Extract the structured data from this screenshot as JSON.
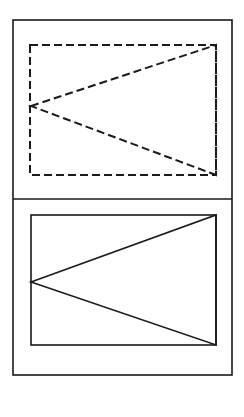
{
  "figure": {
    "title": "Two-panel line drawing: dashed rectangle with inscribed triangle above, solid rectangle with inscribed triangle below",
    "canvas": {
      "width": 244,
      "height": 417
    },
    "background_color": "#ffffff",
    "stroke_color": "#1a1a1a",
    "panels": [
      {
        "id": "top-panel",
        "label": "Top panel (dashed construction)",
        "style": "dashed",
        "frame": {
          "x1": 13,
          "y1": 20,
          "x2": 232,
          "y2": 199
        },
        "rectangle": {
          "name": "dashed-rectangle",
          "x1": 30,
          "y1": 45,
          "x2": 216,
          "y2": 175,
          "stroke_width": 2,
          "dash_pattern": "8 4"
        },
        "triangle": {
          "name": "dashed-triangle",
          "points": [
            [
              31,
              106
            ],
            [
              216,
              45
            ],
            [
              216,
              175
            ]
          ],
          "stroke_width": 2,
          "dash_pattern": "8 4"
        }
      },
      {
        "id": "bottom-panel",
        "label": "Bottom panel (solid result)",
        "style": "solid",
        "frame": {
          "x1": 13,
          "y1": 199,
          "x2": 232,
          "y2": 375
        },
        "rectangle": {
          "name": "solid-rectangle",
          "x1": 31,
          "y1": 215,
          "x2": 216,
          "y2": 345,
          "stroke_width": 1.6,
          "dash_pattern": "none"
        },
        "triangle": {
          "name": "solid-triangle",
          "points": [
            [
              31,
              282
            ],
            [
              216,
              215
            ],
            [
              216,
              345
            ]
          ],
          "stroke_width": 1.6,
          "dash_pattern": "none"
        }
      }
    ],
    "outer_frame": {
      "name": "outer-frame",
      "x1": 13,
      "y1": 20,
      "x2": 232,
      "y2": 375,
      "stroke_width": 1.6
    },
    "divider": {
      "name": "panel-divider",
      "x1": 13,
      "y1": 199,
      "x2": 232,
      "y2": 199,
      "stroke_width": 1.6
    }
  }
}
